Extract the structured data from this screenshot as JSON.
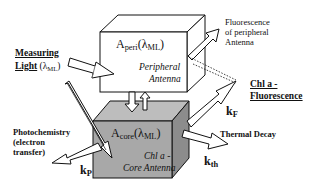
{
  "diagram": {
    "type": "antenna-energy-flow-schematic",
    "colors": {
      "peripheral_box_face": "#ffffff",
      "core_box_face": "#a8a8a8",
      "core_box_top": "#bdbdbd",
      "core_box_side": "#8c8c8c",
      "outline": "#111111"
    },
    "peripheral_box": {
      "absorbance_main": "A",
      "absorbance_sub": "peri",
      "lambda": "(λ",
      "lambda_sub": "ML",
      "lambda_close": ")",
      "name_line1": "Peripheral",
      "name_line2": "Antenna"
    },
    "core_box": {
      "absorbance_main": "A",
      "absorbance_sub": "core",
      "lambda": "(λ",
      "lambda_sub": "ML",
      "lambda_close": ")",
      "name_line1": "Chl a -",
      "name_line2": "Core Antenna"
    },
    "labels": {
      "measuring_light_line1": "Measuring",
      "measuring_light_line2": "Light",
      "measuring_light_lambda": "(λ",
      "measuring_light_lambda_sub": "ML",
      "measuring_light_close": ")",
      "fluorescence_peripheral_line1": "Fluorescence",
      "fluorescence_peripheral_line2": "of peripheral",
      "fluorescence_peripheral_line3": "Antenna",
      "chl_fluorescence_line1": "Chl a -",
      "chl_fluorescence_line2": "Fluorescence",
      "photochemistry_line1": "Photochemistry",
      "photochemistry_line2": "(electron",
      "photochemistry_line3": "transfer)",
      "thermal_decay": "Thermal Decay"
    },
    "rate_constants": {
      "kF_main": "k",
      "kF_sub": "F",
      "kP_main": "k",
      "kP_sub": "P",
      "kth_main": "k",
      "kth_sub": "th"
    },
    "flows": [
      {
        "from": "Measuring Light",
        "to": "Peripheral Antenna"
      },
      {
        "from": "Measuring Light",
        "to": "Core Antenna"
      },
      {
        "from": "Peripheral Antenna",
        "to": "Core Antenna",
        "bidirectional": true
      },
      {
        "from": "Peripheral Antenna",
        "to": "Fluorescence of peripheral Antenna"
      },
      {
        "from": "Core Antenna",
        "to": "Chl a - Fluorescence",
        "rate": "kF"
      },
      {
        "from": "Core Antenna",
        "to": "Photochemistry (electron transfer)",
        "rate": "kP"
      },
      {
        "from": "Core Antenna",
        "to": "Thermal Decay",
        "rate": "kth"
      }
    ]
  }
}
